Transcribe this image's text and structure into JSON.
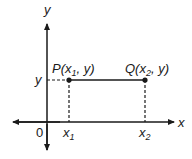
{
  "diagram": {
    "axes": {
      "x_label": "x",
      "y_label": "y",
      "origin_label": "0"
    },
    "points": [
      {
        "name": "P",
        "label_prefix": "P(",
        "var": "x",
        "sub": "1",
        "suffix": ", y)"
      },
      {
        "name": "Q",
        "label_prefix": "Q(",
        "var": "x",
        "sub": "2",
        "suffix": ", y)"
      }
    ],
    "x_ticks": [
      {
        "var": "x",
        "sub": "1"
      },
      {
        "var": "x",
        "sub": "2"
      }
    ],
    "y_tick": {
      "label": "y"
    },
    "colors": {
      "line": "#1a1a1a",
      "background": "#ffffff"
    }
  }
}
